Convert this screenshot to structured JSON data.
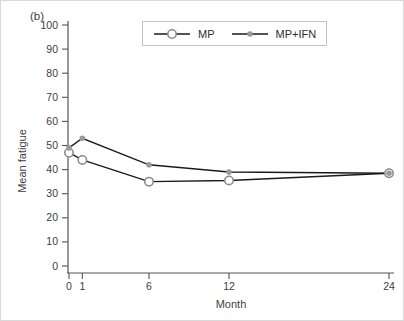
{
  "figure": {
    "panel_label": "(b)",
    "colors": {
      "line": "#1a1a1a",
      "mp_marker_stroke": "#8c8c8c",
      "mp_marker_fill": "#ffffff",
      "mpifn_marker_fill": "#9a9a9a",
      "axis": "#555555",
      "text": "#3d3d3d",
      "legend_border": "#c4c4c4"
    }
  },
  "chart_data": {
    "type": "line",
    "title": "",
    "xlabel": "Month",
    "ylabel": "Mean fatigue",
    "x": [
      0,
      1,
      6,
      12,
      24
    ],
    "x_ticks": [
      0,
      1,
      6,
      12,
      24
    ],
    "xlim": [
      0,
      24
    ],
    "ylim": [
      0,
      100
    ],
    "y_tick_step": 10,
    "grid": false,
    "legend_position": "top-center",
    "series": [
      {
        "name": "MP",
        "marker": "open-circle",
        "values": [
          47,
          44,
          35,
          35.5,
          38.5
        ]
      },
      {
        "name": "MP+IFN",
        "marker": "filled-dot",
        "values": [
          49,
          53,
          42,
          39,
          38.5
        ]
      }
    ]
  }
}
